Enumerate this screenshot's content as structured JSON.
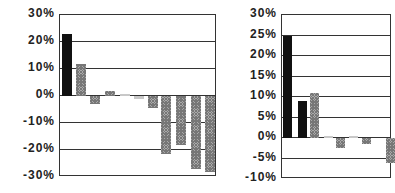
{
  "chart_data": [
    {
      "type": "bar",
      "title": "",
      "xlabel": "",
      "ylabel": "",
      "ylim": [
        -30,
        30
      ],
      "yticks": [
        "30%",
        "20%",
        "10%",
        "0%",
        "-10%",
        "-20%",
        "-30%"
      ],
      "grid": true,
      "categories": [
        "1",
        "2",
        "3",
        "4",
        "5",
        "6",
        "7",
        "8",
        "9",
        "10",
        "11"
      ],
      "values": [
        23,
        12,
        -3,
        2,
        0,
        -1,
        -4.5,
        -21.5,
        -18,
        -27,
        -28
      ],
      "bar_styles": [
        "solid",
        "hatch",
        "hatch",
        "hatch",
        "light",
        "light",
        "hatch",
        "hatch",
        "hatch",
        "hatch",
        "hatch"
      ]
    },
    {
      "type": "bar",
      "title": "",
      "xlabel": "",
      "ylabel": "",
      "ylim": [
        -10,
        30
      ],
      "yticks": [
        "30%",
        "25%",
        "20%",
        "15%",
        "10%",
        "5%",
        "0%",
        "-5%",
        "-10%"
      ],
      "grid": true,
      "categories": [
        "1",
        "2",
        "3",
        "4",
        "5",
        "6",
        "7",
        "8"
      ],
      "values": [
        25,
        9,
        11,
        0,
        -2.5,
        0,
        -1.5,
        -6
      ],
      "bar_styles": [
        "solid",
        "solid",
        "hatch",
        "light",
        "hatch",
        "light",
        "hatch",
        "hatch"
      ]
    }
  ]
}
